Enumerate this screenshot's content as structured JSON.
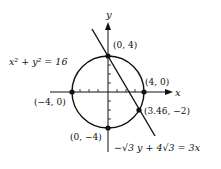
{
  "diagram": {
    "axis_x_label": "x",
    "axis_y_label": "y",
    "circle_equation": "x² + y² = 16",
    "line_equation": "−√3 y + 4√3 = 3x",
    "points": [
      {
        "label": "(0, 4)"
      },
      {
        "label": "(4, 0)"
      },
      {
        "label": "(−4, 0)"
      },
      {
        "label": "(0, −4)"
      },
      {
        "label": "(3.46, −2)"
      }
    ],
    "colors": {
      "ink": "#111111",
      "background": "#ffffff"
    }
  }
}
